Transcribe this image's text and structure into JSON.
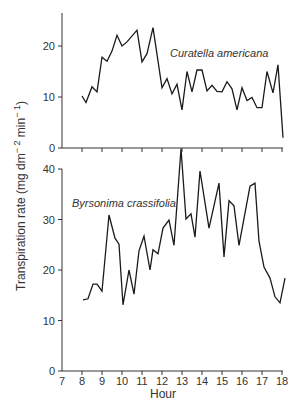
{
  "chart_data": [
    {
      "type": "line",
      "panel": "top",
      "title": "",
      "annotation": "Curatella americana",
      "xlabel": "Hour",
      "ylabel": "Transpiration rate (mg dm⁻² min⁻¹)",
      "xlim": [
        7,
        18
      ],
      "ylim": [
        0,
        26.5
      ],
      "yticks": [
        0,
        10,
        20
      ],
      "grid": false,
      "series": [
        {
          "name": "Curatella americana",
          "x": [
            8.0,
            8.2,
            8.5,
            8.75,
            9.0,
            9.25,
            9.5,
            9.75,
            10.0,
            10.25,
            10.75,
            11.0,
            11.25,
            11.55,
            12.0,
            12.25,
            12.5,
            12.75,
            13.0,
            13.25,
            13.5,
            13.75,
            14.0,
            14.25,
            14.5,
            14.75,
            15.0,
            15.25,
            15.5,
            15.75,
            16.0,
            16.25,
            16.5,
            16.75,
            17.0,
            17.25,
            17.55,
            17.8
          ],
          "y": [
            10.2,
            8.9,
            12.0,
            11.0,
            17.8,
            17.0,
            19.0,
            22.1,
            20.0,
            20.8,
            23.1,
            16.9,
            18.5,
            23.6,
            11.8,
            13.6,
            10.6,
            12.5,
            7.5,
            15.0,
            11.0,
            15.3,
            15.3,
            11.2,
            12.3,
            11.1,
            11.0,
            13.0,
            11.6,
            7.5,
            11.8,
            9.3,
            9.9,
            7.9,
            7.9,
            15.0,
            10.8,
            16.3
          ],
          "end_point": {
            "x": 18.05,
            "y": 2.0
          }
        }
      ]
    },
    {
      "type": "line",
      "panel": "bottom",
      "title": "",
      "annotation": "Byrsonima crassifolia",
      "xlabel": "Hour",
      "ylabel": "Transpiration rate (mg dm⁻² min⁻¹)",
      "xlim": [
        7,
        18
      ],
      "ylim": [
        0,
        40
      ],
      "yticks": [
        0,
        10,
        20,
        30,
        40
      ],
      "xticks": [
        7,
        8,
        9,
        10,
        11,
        12,
        13,
        14,
        15,
        16,
        17,
        18
      ],
      "grid": false,
      "series": [
        {
          "name": "Byrsonima crassifolia",
          "x": [
            8.05,
            8.3,
            8.55,
            8.75,
            9.0,
            9.35,
            9.65,
            9.85,
            10.05,
            10.35,
            10.6,
            10.85,
            11.1,
            11.4,
            11.55,
            11.8,
            12.05,
            12.35,
            12.6,
            12.95,
            13.2,
            13.45,
            13.65,
            13.9,
            14.35,
            14.85,
            15.1,
            15.35,
            15.6,
            15.85,
            16.4,
            16.65,
            16.85,
            17.1,
            17.4,
            17.65,
            17.9,
            18.15
          ],
          "y": [
            14.1,
            14.3,
            17.2,
            17.2,
            15.8,
            30.9,
            26.3,
            25.1,
            13.1,
            20.0,
            15.2,
            23.8,
            26.7,
            20.0,
            24.0,
            23.2,
            28.3,
            29.9,
            24.9,
            44.0,
            30.1,
            31.1,
            26.5,
            39.6,
            28.3,
            37.2,
            22.6,
            33.7,
            32.7,
            24.9,
            36.6,
            37.2,
            25.7,
            20.6,
            18.4,
            14.7,
            13.5,
            18.4
          ]
        }
      ]
    }
  ],
  "labels": {
    "y_axis_title": "Transpiration rate (mg dm",
    "y_axis_exp1": "− 2",
    "y_axis_mid": " min",
    "y_axis_exp2": "− 1",
    "y_axis_close": ")",
    "x_axis_title": "Hour",
    "top_species": "Curatella americana",
    "bottom_species": "Byrsonima crassifolia",
    "top_yticks": [
      "0",
      "10",
      "20"
    ],
    "bottom_yticks": [
      "0",
      "10",
      "20",
      "30",
      "40"
    ],
    "xticks": [
      "7",
      "8",
      "9",
      "10",
      "11",
      "12",
      "13",
      "14",
      "15",
      "16",
      "17",
      "18"
    ]
  },
  "colors": {
    "line": "#1a1a1a",
    "axis": "#333333",
    "text": "#333333",
    "background": "#ffffff"
  }
}
